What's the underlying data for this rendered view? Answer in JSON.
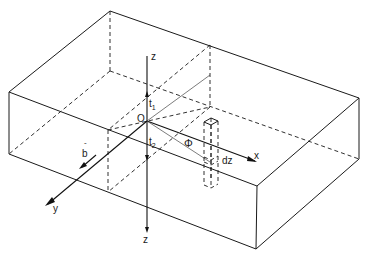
{
  "figure": {
    "colors": {
      "line": "#1a1a1a",
      "background": "#ffffff"
    }
  },
  "labels": {
    "z_top": "z",
    "z_bottom": "z",
    "x": "x",
    "y": "y",
    "origin": "O",
    "t1": "t",
    "t1_sub": "1",
    "t2": "t",
    "t2_sub": "2",
    "phi": "Φ",
    "dz": "dz",
    "b": "b",
    "b_bar": "-"
  }
}
